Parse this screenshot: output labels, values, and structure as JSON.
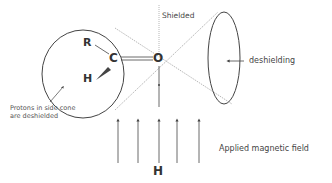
{
  "diagram": {
    "type": "carbonyl anisotropy (NMR shielding cone)",
    "atoms": {
      "r": "R",
      "c": "C",
      "h_atom": "H",
      "o": "O"
    },
    "labels": {
      "shielded": "Shielded",
      "deshielding": "deshielding",
      "side_cone_line1": "Protons in side cone",
      "side_cone_line2": "are deshielded",
      "field_symbol": "H",
      "applied_field": "Applied magnetic field"
    },
    "field_arrows_count": 5,
    "colors": {
      "line": "#444444",
      "dotted": "#888888",
      "text": "#444444"
    }
  }
}
